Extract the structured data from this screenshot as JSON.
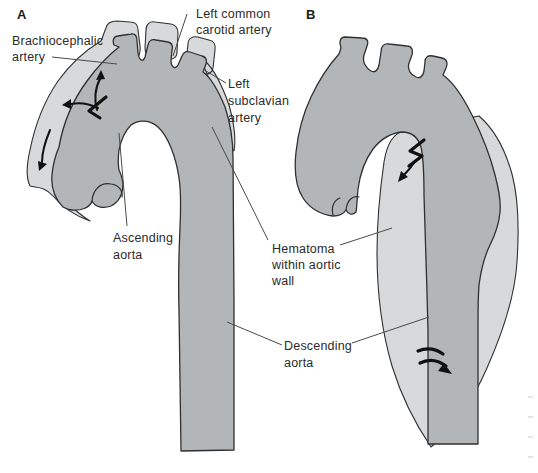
{
  "figure": {
    "panel_a_letter": "A",
    "panel_b_letter": "B"
  },
  "labels": {
    "brachiocephalic": {
      "line1": "Brachiocephalic",
      "line2": "artery"
    },
    "left_common_carotid": {
      "line1": "Left common",
      "line2": "carotid artery"
    },
    "left_subclavian": {
      "line1": "Left",
      "line2": "subclavian",
      "line3": "artery"
    },
    "ascending_aorta": {
      "line1": "Ascending",
      "line2": "aorta"
    },
    "hematoma": {
      "line1": "Hematoma",
      "line2": "within aortic",
      "line3": "wall"
    },
    "descending_aorta": {
      "line1": "Descending",
      "line2": "aorta"
    }
  },
  "colors": {
    "background": "#ffffff",
    "aorta_fill": "#b3b6b8",
    "hematoma_fill": "#d7d9da",
    "outline": "#2e3032",
    "leader_line": "#4a4a4a",
    "arrow": "#111111",
    "text": "#2b2b2b"
  }
}
